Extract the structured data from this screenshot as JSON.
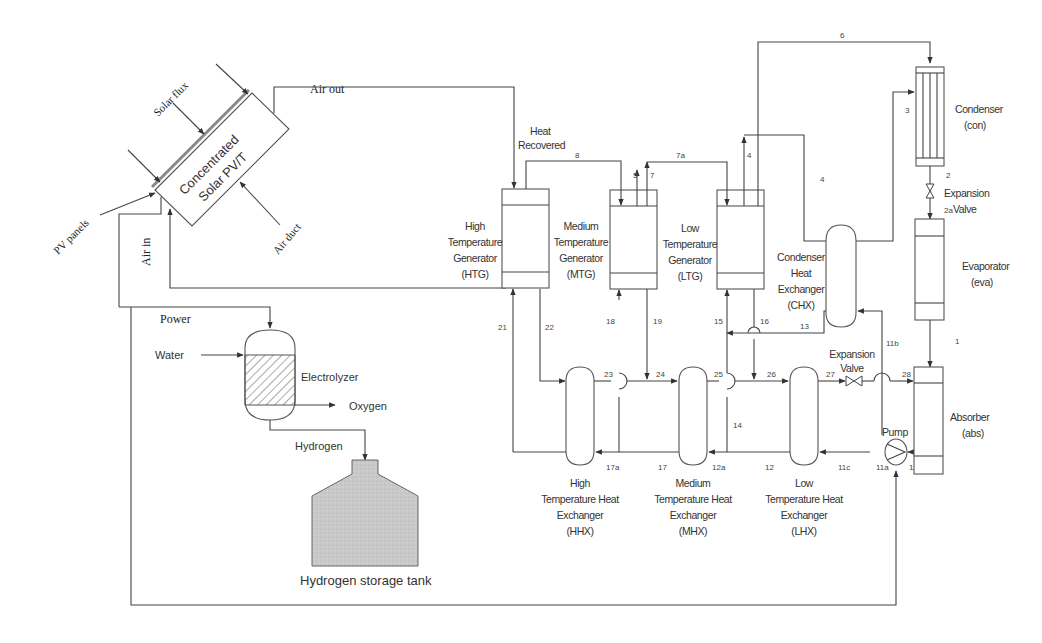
{
  "diagram": {
    "solar": {
      "panel_label_line1": "Concentrated",
      "panel_label_line2": "Solar PV/T",
      "solar_flux": "Solar flux",
      "pv_panels": "PV panels",
      "air_duct": "Air duct",
      "air_out": "Air out",
      "air_in": "Air in"
    },
    "hydrogen": {
      "power": "Power",
      "water": "Water",
      "electrolyzer": "Electrolyzer",
      "oxygen": "Oxygen",
      "hydrogen": "Hydrogen",
      "tank": "Hydrogen storage tank"
    },
    "components": {
      "heat_recovered_1": "Heat",
      "heat_recovered_2": "Recovered",
      "htg": [
        "High",
        "Temperature",
        "Generator",
        "(HTG)"
      ],
      "mtg": [
        "Medium",
        "Temperature",
        "Generator",
        "(MTG)"
      ],
      "ltg": [
        "Low",
        "Temperature",
        "Generator",
        "(LTG)"
      ],
      "chx": [
        "Condenser",
        "Heat",
        "Exchanger",
        "(CHX)"
      ],
      "con": [
        "Condenser",
        "(con)"
      ],
      "eva": [
        "Evaporator",
        "(eva)"
      ],
      "abs": [
        "Absorber",
        "(abs)"
      ],
      "exp_valve_top": [
        "Expansion",
        "Valve"
      ],
      "exp_valve_bottom": [
        "Expansion",
        "Valve"
      ],
      "pump": "Pump",
      "hhx": [
        "High",
        "Temperature Heat",
        "Exchanger",
        "(HHX)"
      ],
      "mhx": [
        "Medium",
        "Temperature Heat",
        "Exchanger",
        "(MHX)"
      ],
      "lhx": [
        "Low",
        "Temperature Heat",
        "Exchanger",
        "(LHX)"
      ]
    },
    "state_points": {
      "p1": "1",
      "p2": "2",
      "p2a": "2a",
      "p3": "3",
      "p4a": "4",
      "p4b": "4",
      "p5": "5",
      "p6": "6",
      "p7": "7",
      "p7a": "7a",
      "p8": "8",
      "p11": "11",
      "p11a": "11a",
      "p11b": "11b",
      "p11c": "11c",
      "p12": "12",
      "p12a": "12a",
      "p13": "13",
      "p14": "14",
      "p15": "15",
      "p16": "16",
      "p17": "17",
      "p17a": "17a",
      "p18": "18",
      "p19": "19",
      "p21": "21",
      "p22": "22",
      "p23": "23",
      "p24": "24",
      "p25": "25",
      "p26": "26",
      "p27": "27",
      "p28": "28"
    },
    "colors": {
      "line": "#444444",
      "tank_fill": "#c8c8c8",
      "background": "#ffffff"
    }
  }
}
